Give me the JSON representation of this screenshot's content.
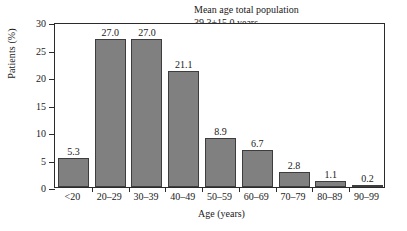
{
  "chart_data": {
    "type": "bar",
    "title": "",
    "xlabel": "Age (years)",
    "ylabel": "Patients (%)",
    "categories": [
      "<20",
      "20–29",
      "30–39",
      "40–49",
      "50–59",
      "60–69",
      "70–79",
      "80–89",
      "90–99"
    ],
    "values": [
      5.3,
      27.0,
      27.0,
      21.1,
      8.9,
      6.7,
      2.8,
      1.1,
      0.2
    ],
    "value_labels": [
      "5.3",
      "27.0",
      "27.0",
      "21.1",
      "8.9",
      "6.7",
      "2.8",
      "1.1",
      "0.2"
    ],
    "ylim": [
      0,
      30
    ],
    "yticks": [
      0,
      5,
      10,
      15,
      20,
      25,
      30
    ],
    "ytick_labels": [
      "0",
      "5",
      "10",
      "15",
      "20",
      "25",
      "30"
    ],
    "grid": false,
    "legend": false,
    "bar_color": "#808080",
    "bar_edge_color": "#3d3d3d",
    "axis_color": "#2b2b2b",
    "annotations": [
      "Mean age total population",
      "39.3±15.0 years"
    ]
  }
}
